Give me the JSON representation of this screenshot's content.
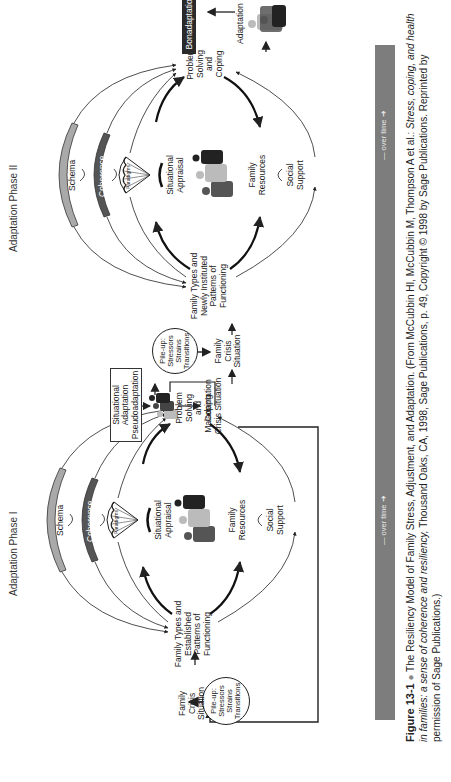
{
  "figure": {
    "number": "Figure 13-1",
    "title": "The Resiliency Model of Family Stress, Adjustment, and Adaptation.",
    "citation_prefix": "(From McCubbin HI, McCubbin M, Thompson A et al.: ",
    "citation_book": "Stress, coping, and health in families: a sense of coherence and resiliency,",
    "citation_suffix": "Thousand Oaks, CA, 1998, Sage Publications, p. 49, Copyright © 1998 by Sage Publications. Reprinted by permission of Sage Publications.)"
  },
  "phases": {
    "phase1": "Adaptation Phase I",
    "phase2": "Adaptation Phase II"
  },
  "time_bar": {
    "label1": "over time",
    "label2": "over time",
    "color": "#7d7d7d"
  },
  "phase1": {
    "pileup": [
      "Pile-up:",
      "Stressors",
      "Strains",
      "Transitions"
    ],
    "crisis": [
      "Family",
      "Crisis",
      "Situation"
    ],
    "family_types": [
      "Family Types and",
      "Established",
      "Patterns of",
      "Functioning"
    ],
    "schema": "Schema",
    "coherence": "Coherence",
    "paradigms": "Paradigms",
    "appraisal": [
      "Situational",
      "Appraisal"
    ],
    "resources": [
      "Family",
      "Resources"
    ],
    "support": [
      "Social",
      "Support"
    ],
    "problem_solving": [
      "Problem",
      "Solving",
      "and",
      "Coping"
    ]
  },
  "middle": {
    "situational_box": [
      "Situational",
      "Adaptation",
      "Pseudoadaptation"
    ],
    "maladaptation": [
      "Maladaptation",
      "Crisis Situation"
    ],
    "pileup": [
      "Pile-up:",
      "Stressors",
      "Strains",
      "Transitions"
    ],
    "crisis": [
      "Family",
      "Crisis",
      "Situation"
    ]
  },
  "phase2": {
    "family_types": [
      "Family Types and",
      "Newly Instituted",
      "Patterns of",
      "Functioning"
    ],
    "schema": "Schema",
    "coherence": "Coherence",
    "paradigms": "Paradigms",
    "appraisal": [
      "Situational",
      "Appraisal"
    ],
    "resources": [
      "Family",
      "Resources"
    ],
    "support": [
      "Social",
      "Support"
    ],
    "problem_solving": [
      "Problem",
      "Solving",
      "and",
      "Coping"
    ],
    "adaptation": "Adaptation",
    "bonadaptation": "Bonadaptation"
  },
  "colors": {
    "schema_fill": "#a9a9a9",
    "coherence_fill": "#555555",
    "bonadaptation_bg": "#2a2a2a",
    "ink": "#222222"
  }
}
